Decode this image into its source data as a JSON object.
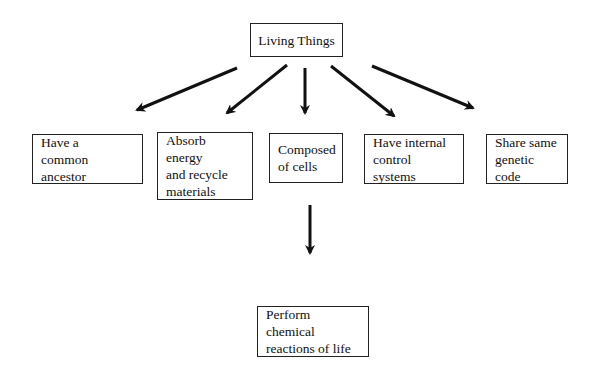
{
  "diagram": {
    "root": {
      "label": "Living Things"
    },
    "children": [
      {
        "label": "Have a\ncommon ancestor"
      },
      {
        "label": "Absorb energy\nand recycle\nmaterials"
      },
      {
        "label": "Composed\nof cells"
      },
      {
        "label": "Have internal\ncontrol systems"
      },
      {
        "label": "Share same\ngenetic code"
      }
    ],
    "sub": {
      "parent": "Composed\nof cells",
      "label": "Perform chemical\nreactions of life"
    },
    "edges": [
      {
        "from": "Living Things",
        "to": "Have a common ancestor"
      },
      {
        "from": "Living Things",
        "to": "Absorb energy and recycle materials"
      },
      {
        "from": "Living Things",
        "to": "Composed of cells"
      },
      {
        "from": "Living Things",
        "to": "Have internal control systems"
      },
      {
        "from": "Living Things",
        "to": "Share same genetic code"
      },
      {
        "from": "Composed of cells",
        "to": "Perform chemical reactions of life"
      }
    ],
    "colors": {
      "line": "#111111",
      "background": "#ffffff"
    }
  }
}
